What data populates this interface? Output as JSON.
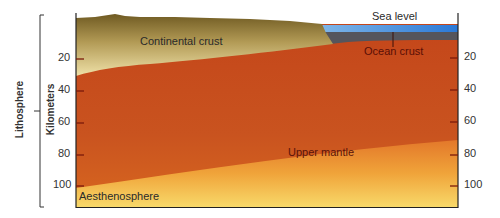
{
  "diagram": {
    "labels": {
      "sea_level": "Sea level",
      "continental_crust": "Continental crust",
      "ocean_crust": "Ocean crust",
      "upper_mantle": "Upper mantle",
      "aesthenosphere": "Aesthenosphere"
    },
    "axis": {
      "title": "Kilometers",
      "ticks": [
        "20",
        "40",
        "60",
        "80",
        "100"
      ]
    },
    "bracket_label": "Lithosphere",
    "colors": {
      "sea": "#3a86d8",
      "ocean_crust": "#5a5a62",
      "continental_crust_top": "#7a6428",
      "continental_crust_bottom": "#e8d79a",
      "mantle": "#c2481a",
      "aesthenosphere_top": "#e88a2c",
      "aesthenosphere_bottom": "#f6d466"
    }
  }
}
